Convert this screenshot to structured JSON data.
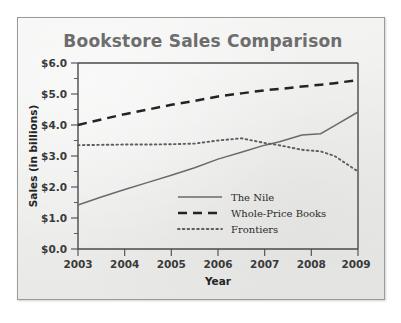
{
  "chart_data": {
    "type": "line",
    "title": "Bookstore Sales Comparison",
    "xlabel": "Year",
    "ylabel": "Sales (in billions)",
    "xlim": [
      2003,
      2009
    ],
    "ylim": [
      0.0,
      6.0
    ],
    "grid": false,
    "legend_position": "center-right",
    "x_tick_labels": [
      "2003",
      "2004",
      "2005",
      "2006",
      "2007",
      "2008",
      "2009"
    ],
    "y_tick_labels": [
      "$0.0",
      "$1.0",
      "$2.0",
      "$3.0",
      "$4.0",
      "$5.0",
      "$6.0"
    ],
    "y_ticks": [
      0.0,
      1.0,
      2.0,
      3.0,
      4.0,
      5.0,
      6.0
    ],
    "y_minor_ticks": [
      0.5,
      1.5,
      2.5,
      3.5,
      4.5,
      5.5
    ],
    "x": [
      2003,
      2003.5,
      2004,
      2004.5,
      2005,
      2005.5,
      2006,
      2006.5,
      2007,
      2007.3,
      2007.8,
      2008.2,
      2008.5,
      2009
    ],
    "series": [
      {
        "name": "The Nile",
        "style": "solid",
        "color": "#6a6a6a",
        "values": [
          1.42,
          1.68,
          1.92,
          2.15,
          2.38,
          2.62,
          2.9,
          3.12,
          3.35,
          3.45,
          3.68,
          3.72,
          3.98,
          4.42
        ]
      },
      {
        "name": "Whole-Price Books",
        "style": "dashed",
        "color": "#232323",
        "values": [
          4.0,
          4.18,
          4.35,
          4.5,
          4.65,
          4.78,
          4.92,
          5.02,
          5.12,
          5.16,
          5.24,
          5.3,
          5.35,
          5.45
        ]
      },
      {
        "name": "Frontiers",
        "style": "dotted",
        "color": "#5d5d5d",
        "values": [
          3.35,
          3.36,
          3.37,
          3.37,
          3.38,
          3.4,
          3.5,
          3.57,
          3.42,
          3.35,
          3.2,
          3.15,
          3.0,
          2.5
        ]
      }
    ]
  },
  "legend": {
    "items": [
      {
        "label": "The Nile"
      },
      {
        "label": "Whole-Price Books"
      },
      {
        "label": "Frontiers"
      }
    ]
  }
}
